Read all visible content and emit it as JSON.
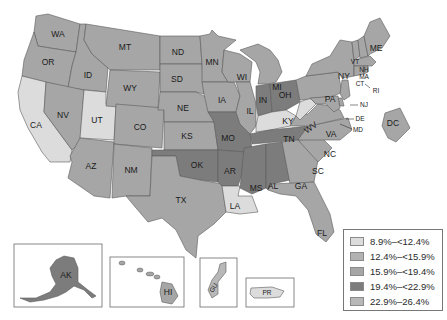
{
  "legend": {
    "items": [
      {
        "label": "8.9%–<12.4%",
        "color": "#dcdcdc"
      },
      {
        "label": "12.4%–<15.9%",
        "color": "#b2b2b2"
      },
      {
        "label": "15.9%–<19.4%",
        "color": "#a6a6a6"
      },
      {
        "label": "19.4%–<22.9%",
        "color": "#7c7c7c"
      },
      {
        "label": "22.9%–26.4%",
        "color": "#b8b8b8"
      }
    ]
  },
  "states": {
    "WA": "WA",
    "OR": "OR",
    "CA": "CA",
    "ID": "ID",
    "NV": "NV",
    "UT": "UT",
    "AZ": "AZ",
    "MT": "MT",
    "WY": "WY",
    "CO": "CO",
    "NM": "NM",
    "ND": "ND",
    "SD": "SD",
    "NE": "NE",
    "KS": "KS",
    "OK": "OK",
    "TX": "TX",
    "MN": "MN",
    "IA": "IA",
    "MO": "MO",
    "AR": "AR",
    "LA": "LA",
    "WI": "WI",
    "IL": "IL",
    "MI": "MI",
    "IN": "IN",
    "OH": "OH",
    "KY": "KY",
    "TN": "TN",
    "MS": "MS",
    "AL": "AL",
    "GA": "GA",
    "FL": "FL",
    "SC": "SC",
    "NC": "NC",
    "VA": "VA",
    "WV": "WV",
    "PA": "PA",
    "NY": "NY",
    "VT": "VT",
    "NH": "NH",
    "ME": "ME",
    "MA": "MA",
    "CT": "CT",
    "RI": "RI",
    "NJ": "NJ",
    "DE": "DE",
    "MD": "MD",
    "DC": "DC",
    "AK": "AK",
    "HI": "HI",
    "GU": "GU",
    "PR": "PR"
  }
}
